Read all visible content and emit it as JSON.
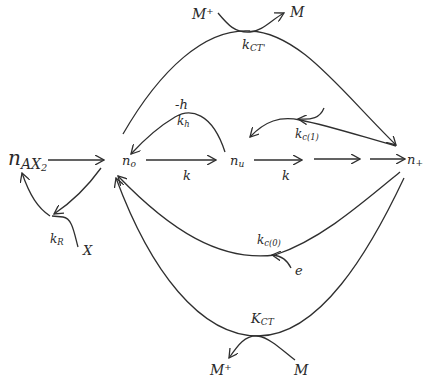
{
  "nodes": {
    "n_ax2": {
      "base": "n",
      "sub": "AX",
      "sub2": "2"
    },
    "n_o": {
      "base": "n",
      "sub": "o"
    },
    "n_u": {
      "base": "n",
      "sub": "u"
    },
    "n_plus": {
      "base": "n",
      "sub": "+"
    }
  },
  "species": {
    "m_plus_top": "M⁺",
    "m_top": "M",
    "m_plus_bottom": "M⁺",
    "m_bottom": "M",
    "x": "X",
    "e": "e"
  },
  "rates": {
    "k_ct_top": {
      "base": "k",
      "sub": "CT'"
    },
    "minus_h": "-h",
    "k_h": {
      "base": "k",
      "sub": "h"
    },
    "k_c1": {
      "base": "k",
      "sub": "c(1)"
    },
    "k_1": "k",
    "k_2": "k",
    "k_r": {
      "base": "k",
      "sub": "R"
    },
    "k_c0": {
      "base": "k",
      "sub": "c(0)"
    },
    "k_ct_bottom": {
      "base": "K",
      "sub": "CT"
    }
  }
}
